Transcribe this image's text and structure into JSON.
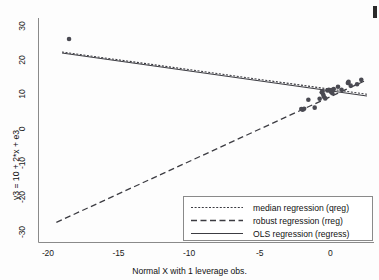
{
  "chart_data": {
    "type": "scatter",
    "title": "",
    "xlabel": "Normal X with 1 leverage obs.",
    "ylabel": "y3 = 10 + 2*x + e3",
    "xlim": [
      -20.7,
      3.1
    ],
    "ylim": [
      -33.0,
      32.5
    ],
    "xticks": [
      -20,
      -15,
      -10,
      -5,
      0
    ],
    "xticklabels": [
      "-20",
      "-15",
      "-10",
      "-5",
      "0"
    ],
    "yticks": [
      30,
      20,
      10,
      0,
      -10,
      -20,
      -30
    ],
    "yticklabels": [
      "30",
      "20",
      "10",
      "0",
      "-10",
      "-20",
      "-30"
    ],
    "grid": false,
    "legend_position": "lower right",
    "points": [
      {
        "x": -18.5,
        "y": 26.4
      },
      {
        "x": -2.05,
        "y": 6.0
      },
      {
        "x": -1.95,
        "y": 5.8
      },
      {
        "x": -1.85,
        "y": 6.1
      },
      {
        "x": -1.55,
        "y": 8.7
      },
      {
        "x": -1.1,
        "y": 6.4
      },
      {
        "x": -0.75,
        "y": 9.0
      },
      {
        "x": -0.6,
        "y": 10.9
      },
      {
        "x": -0.55,
        "y": 11.2
      },
      {
        "x": -0.5,
        "y": 10.2
      },
      {
        "x": -0.45,
        "y": 9.6
      },
      {
        "x": -0.35,
        "y": 9.1
      },
      {
        "x": -0.2,
        "y": 11.4
      },
      {
        "x": -0.1,
        "y": 11.6
      },
      {
        "x": 0.0,
        "y": 11.3
      },
      {
        "x": 0.05,
        "y": 11.0
      },
      {
        "x": 0.1,
        "y": 11.5
      },
      {
        "x": 0.15,
        "y": 10.6
      },
      {
        "x": 0.25,
        "y": 11.8
      },
      {
        "x": 0.55,
        "y": 12.5
      },
      {
        "x": 0.8,
        "y": 11.6
      },
      {
        "x": 1.25,
        "y": 13.6
      },
      {
        "x": 1.3,
        "y": 13.9
      },
      {
        "x": 1.45,
        "y": 12.8
      },
      {
        "x": 1.9,
        "y": 13.2
      },
      {
        "x": 2.2,
        "y": 14.5
      }
    ],
    "series": [
      {
        "name": "median regression (qreg)",
        "style": "dotted",
        "x": [
          -19.0,
          2.6
        ],
        "y": [
          22.6,
          10.3
        ]
      },
      {
        "name": "robust regression (rreg)",
        "style": "dashed",
        "x": [
          -19.4,
          2.4
        ],
        "y": [
          -27.0,
          14.1
        ]
      },
      {
        "name": "OLS regression (regress)",
        "style": "solid",
        "x": [
          -19.0,
          2.6
        ],
        "y": [
          22.3,
          9.8
        ]
      }
    ],
    "legend_entries": [
      {
        "label": "median regression (qreg)",
        "style": "dotted"
      },
      {
        "label": "robust regression (rreg)",
        "style": "dashed"
      },
      {
        "label": "OLS regression (regress)",
        "style": "solid"
      }
    ],
    "colors": {
      "marker": "#4a4a52",
      "line": "#3c3c42",
      "axis": "#8a8a8a",
      "text": "#111111",
      "background": "#fdfdfd"
    }
  }
}
